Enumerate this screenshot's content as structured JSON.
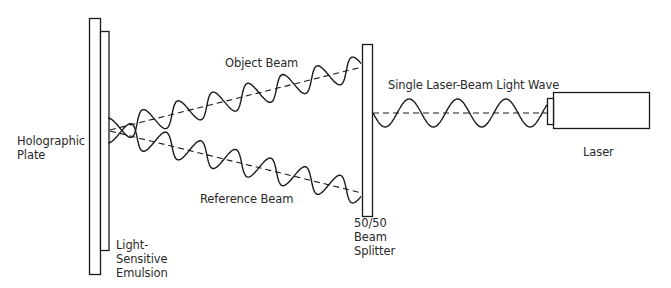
{
  "diagram": {
    "colors": {
      "ink": "#1a1a1a",
      "text": "#2a2a2a",
      "background": "#ffffff"
    },
    "components": {
      "holographic_plate": {
        "label_lines": [
          "Holographic",
          "Plate"
        ]
      },
      "emulsion": {
        "label_lines": [
          "Light-",
          "Sensitive",
          "Emulsion"
        ]
      },
      "beam_splitter": {
        "label_lines": [
          "50/50",
          "Beam",
          "Splitter"
        ]
      },
      "laser": {
        "label": "Laser"
      }
    },
    "beams": {
      "laser_wave": {
        "label": "Single Laser-Beam Light Wave"
      },
      "object_beam": {
        "label": "Object Beam"
      },
      "reference_beam": {
        "label": "Reference Beam"
      }
    },
    "edges": [
      {
        "from": "laser",
        "to": "beam_splitter",
        "label": "Single Laser-Beam Light Wave"
      },
      {
        "from": "beam_splitter",
        "to": "holographic_plate",
        "label": "Object Beam"
      },
      {
        "from": "beam_splitter",
        "to": "holographic_plate",
        "label": "Reference Beam"
      }
    ]
  }
}
